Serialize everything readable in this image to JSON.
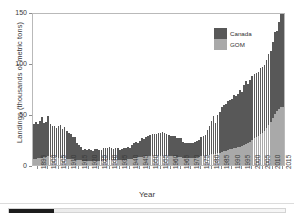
{
  "figure": {
    "legend": {
      "position": "top-right",
      "entries": [
        {
          "label": "Canada",
          "color": "#585858"
        },
        {
          "label": "GOM",
          "color": "#a9a9a9"
        }
      ]
    }
  },
  "viewer": {
    "scrollbar_name": "horizontal-scrollbar"
  },
  "chart_data": {
    "type": "bar",
    "stacked": true,
    "title": "",
    "xlabel": "Year",
    "ylabel": "Landings (thousands of metric tons)",
    "ylim": [
      0,
      150
    ],
    "yticks": [
      0,
      50,
      100,
      150
    ],
    "xticks": [
      1895,
      1900,
      1905,
      1910,
      1915,
      1920,
      1925,
      1930,
      1935,
      1940,
      1945,
      1950,
      1955,
      1960,
      1965,
      1970,
      1975,
      1980,
      1985,
      1990,
      1995,
      2000,
      2005,
      2010,
      2015
    ],
    "grid": false,
    "legend_position": "top-right",
    "x": [
      1893,
      1894,
      1895,
      1896,
      1897,
      1898,
      1899,
      1900,
      1901,
      1902,
      1903,
      1904,
      1905,
      1906,
      1907,
      1908,
      1909,
      1910,
      1911,
      1912,
      1913,
      1914,
      1915,
      1916,
      1917,
      1918,
      1919,
      1920,
      1921,
      1922,
      1923,
      1924,
      1925,
      1926,
      1927,
      1928,
      1929,
      1930,
      1931,
      1932,
      1933,
      1934,
      1935,
      1936,
      1937,
      1938,
      1939,
      1940,
      1941,
      1942,
      1943,
      1944,
      1945,
      1946,
      1947,
      1948,
      1949,
      1950,
      1951,
      1952,
      1953,
      1954,
      1955,
      1956,
      1957,
      1958,
      1959,
      1960,
      1961,
      1962,
      1963,
      1964,
      1965,
      1966,
      1967,
      1968,
      1969,
      1970,
      1971,
      1972,
      1973,
      1974,
      1975,
      1976,
      1977,
      1978,
      1979,
      1980,
      1981,
      1982,
      1983,
      1984,
      1985,
      1986,
      1987,
      1988,
      1989,
      1990,
      1991,
      1992,
      1993,
      1994,
      1995,
      1996,
      1997,
      1998,
      1999,
      2000,
      2001,
      2002,
      2003,
      2004,
      2005,
      2006,
      2007,
      2008,
      2009,
      2010,
      2011,
      2012,
      2013,
      2014,
      2015,
      2016
    ],
    "series": [
      {
        "name": "GOM",
        "color": "#a9a9a9",
        "values": [
          6,
          6,
          7,
          7,
          7,
          8,
          8,
          9,
          8,
          8,
          8,
          8,
          7,
          7,
          7,
          7,
          6,
          6,
          6,
          6,
          5,
          5,
          5,
          5,
          4,
          4,
          4,
          4,
          4,
          4,
          4,
          4,
          4,
          4,
          4,
          4,
          5,
          5,
          5,
          5,
          5,
          5,
          5,
          5,
          5,
          5,
          6,
          6,
          6,
          7,
          7,
          8,
          8,
          8,
          9,
          9,
          9,
          9,
          9,
          9,
          9,
          9,
          9,
          9,
          9,
          9,
          9,
          9,
          9,
          9,
          8,
          8,
          8,
          7,
          7,
          7,
          7,
          7,
          7,
          7,
          8,
          8,
          9,
          9,
          9,
          10,
          10,
          11,
          11,
          11,
          12,
          12,
          13,
          14,
          14,
          15,
          16,
          16,
          17,
          17,
          18,
          18,
          19,
          20,
          21,
          22,
          23,
          25,
          26,
          27,
          28,
          30,
          31,
          33,
          36,
          39,
          42,
          46,
          50,
          53,
          55,
          57,
          57,
          56
        ]
      },
      {
        "name": "Canada",
        "color": "#585858",
        "values": [
          34,
          36,
          33,
          36,
          40,
          33,
          34,
          39,
          32,
          30,
          30,
          28,
          31,
          32,
          28,
          30,
          27,
          25,
          24,
          21,
          22,
          17,
          15,
          13,
          11,
          12,
          11,
          12,
          11,
          10,
          12,
          12,
          11,
          11,
          13,
          13,
          12,
          13,
          12,
          11,
          12,
          12,
          10,
          11,
          12,
          12,
          12,
          11,
          14,
          15,
          16,
          14,
          16,
          18,
          17,
          18,
          19,
          20,
          21,
          21,
          21,
          22,
          22,
          23,
          22,
          21,
          20,
          19,
          19,
          19,
          18,
          18,
          18,
          16,
          15,
          15,
          15,
          15,
          15,
          16,
          16,
          17,
          18,
          19,
          20,
          24,
          28,
          32,
          37,
          30,
          37,
          40,
          44,
          45,
          46,
          48,
          48,
          49,
          52,
          51,
          52,
          56,
          53,
          58,
          61,
          57,
          60,
          62,
          63,
          63,
          63,
          65,
          65,
          65,
          67,
          70,
          70,
          75,
          80,
          78,
          85,
          91,
          91,
          92
        ]
      }
    ]
  }
}
